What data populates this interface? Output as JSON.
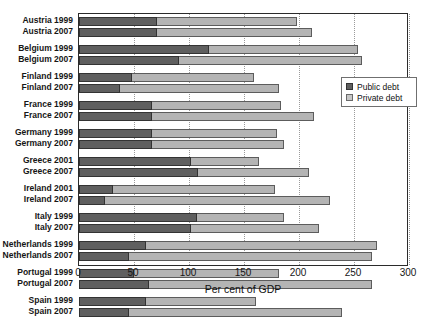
{
  "chart_data": {
    "type": "bar",
    "orientation": "horizontal",
    "stacked": true,
    "title": "",
    "xlabel": "Per cent of GDP",
    "ylabel": "",
    "xlim": [
      0,
      300
    ],
    "xticks": [
      0,
      50,
      100,
      150,
      200,
      250,
      300
    ],
    "grid": "vertical dotted at x ticks",
    "legend_position": "upper right inside plot",
    "categories": [
      "Austria 1999",
      "Austria 2007",
      "Belgium 1999",
      "Belgium 2007",
      "Finland 1999",
      "Finland 2007",
      "France 1999",
      "France 2007",
      "Germany 1999",
      "Germany 2007",
      "Greece 2001",
      "Greece 2007",
      "Ireland 2001",
      "Ireland 2007",
      "Italy 1999",
      "Italy 2007",
      "Netherlands 1999",
      "Netherlands 2007",
      "Portugal 1999",
      "Portugal 2007",
      "Spain 1999",
      "Spain 2007"
    ],
    "series": [
      {
        "name": "Public debt",
        "color": "#5f5f5f",
        "values": [
          71,
          71,
          118,
          91,
          48,
          37,
          66,
          66,
          66,
          66,
          102,
          108,
          31,
          24,
          107,
          102,
          61,
          45,
          50,
          64,
          61,
          45
        ]
      },
      {
        "name": "Private debt",
        "color": "#b4b4b4",
        "values": [
          127,
          141,
          136,
          166,
          111,
          145,
          118,
          148,
          114,
          120,
          62,
          101,
          147,
          204,
          79,
          116,
          210,
          221,
          132,
          202,
          100,
          194
        ]
      }
    ],
    "totals": [
      198,
      212,
      254,
      257,
      159,
      182,
      184,
      214,
      180,
      186,
      164,
      209,
      178,
      228,
      186,
      218,
      271,
      266,
      182,
      266,
      161,
      239
    ],
    "group_breaks_after": [
      1,
      3,
      5,
      7,
      9,
      11,
      13,
      15,
      17,
      19
    ]
  },
  "legend": {
    "items": [
      {
        "label": "Public debt",
        "swatch": "public"
      },
      {
        "label": "Private debt",
        "swatch": "private"
      }
    ]
  },
  "axis": {
    "x_title": "Per cent of GDP",
    "x_tick_labels": [
      "0",
      "50",
      "100",
      "150",
      "200",
      "250",
      "300"
    ]
  }
}
